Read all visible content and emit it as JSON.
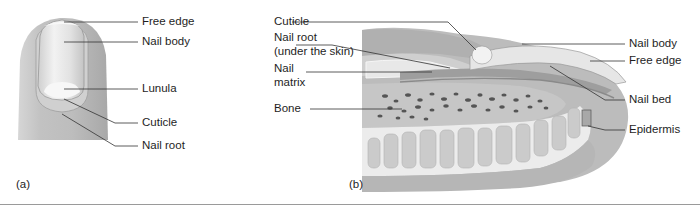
{
  "panel_a": {
    "letter": "(a)",
    "labels": {
      "free_edge": "Free edge",
      "nail_body": "Nail body",
      "lunula": "Lunula",
      "cuticle": "Cuticle",
      "nail_root": "Nail root"
    }
  },
  "panel_b": {
    "letter": "(b)",
    "labels": {
      "cuticle": "Cuticle",
      "nail_root_1": "Nail root",
      "nail_root_2": "(under the skin)",
      "nail_matrix_1": "Nail",
      "nail_matrix_2": "matrix",
      "bone": "Bone",
      "nail_body": "Nail body",
      "free_edge": "Free edge",
      "nail_bed": "Nail bed",
      "epidermis": "Epidermis"
    }
  },
  "colors": {
    "skin": "#c8c8c8",
    "skin_dark": "#a9a9a9",
    "nail": "#e8e8e8",
    "leader": "#333333",
    "rule": "#9a9a9a"
  }
}
